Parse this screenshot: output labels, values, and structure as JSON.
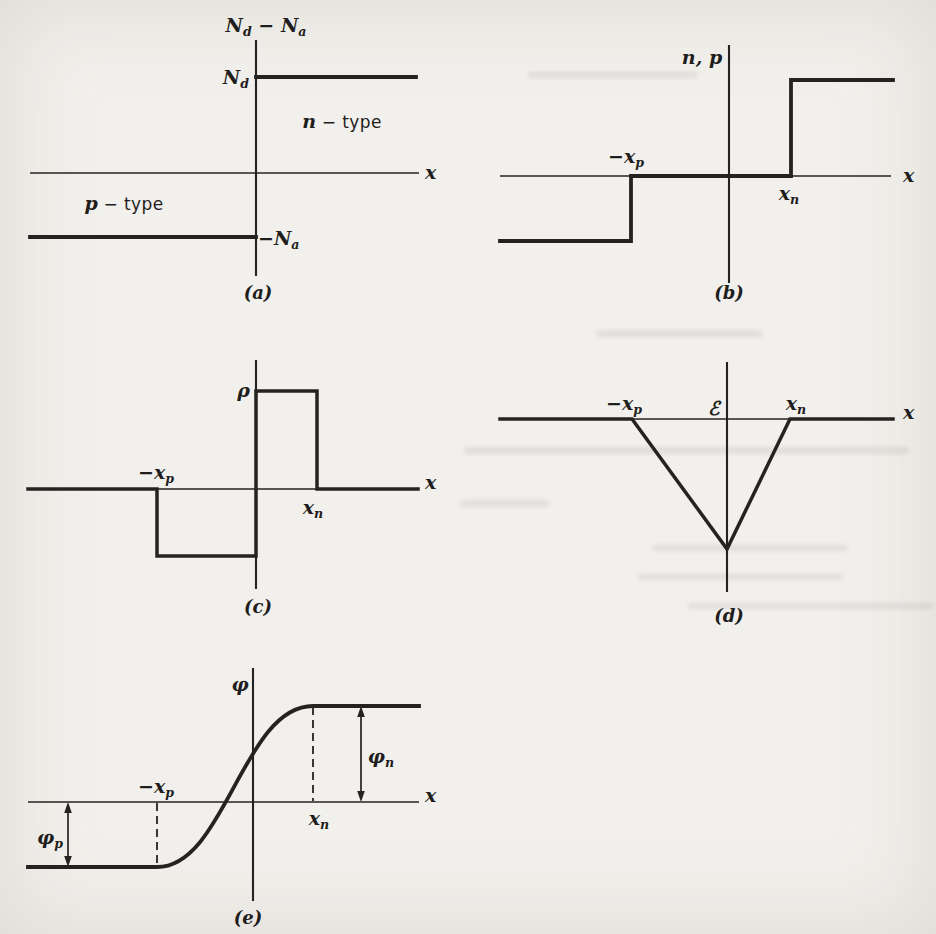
{
  "page": {
    "background": "#f2f0ec",
    "ink": "#242321"
  },
  "panels": {
    "a": {
      "caption": "(a)",
      "x_axis_label": "x",
      "y_axis_title": {
        "base1": "N",
        "sub1": "d",
        "mid": " − ",
        "base2": "N",
        "sub2": "a"
      },
      "level_nd": {
        "base": "N",
        "sub": "d"
      },
      "level_na": {
        "base": "−N",
        "sub": "a"
      },
      "region_n": {
        "var": "n",
        "rest": " − type"
      },
      "region_p": {
        "var": "p",
        "rest": " − type"
      }
    },
    "b": {
      "caption": "(b)",
      "x_axis_label": "x",
      "y_axis_title": {
        "n": "n",
        "sep": ",  ",
        "p": "p"
      },
      "xp": {
        "base": "−x",
        "sub": "p"
      },
      "xn": {
        "base": "x",
        "sub": "n"
      }
    },
    "c": {
      "caption": "(c)",
      "x_axis_label": "x",
      "y_axis_title": "ρ",
      "xp": {
        "base": "−x",
        "sub": "p"
      },
      "xn": {
        "base": "x",
        "sub": "n"
      }
    },
    "d": {
      "caption": "(d)",
      "x_axis_label": "x",
      "field_symbol": "ℰ",
      "xp": {
        "base": "−x",
        "sub": "p"
      },
      "xn": {
        "base": "x",
        "sub": "n"
      }
    },
    "e": {
      "caption": "(e)",
      "x_axis_label": "x",
      "y_axis_title": "φ",
      "xp": {
        "base": "−x",
        "sub": "p"
      },
      "xn": {
        "base": "x",
        "sub": "n"
      },
      "phi_n": {
        "base": "φ",
        "sub": "n"
      },
      "phi_p": {
        "base": "φ",
        "sub": "p"
      }
    }
  },
  "shapes": {
    "a": {
      "yaxis": [
        256,
        40,
        256,
        276
      ],
      "xaxis": [
        30,
        173,
        419,
        173
      ],
      "nd_level": "256,77 416,77",
      "na_level": "30,237 256,237"
    },
    "b": {
      "yaxis": [
        729,
        45,
        729,
        283
      ],
      "xaxis": [
        500,
        176,
        891,
        176
      ],
      "curve": "500,241 631,241 631,176 791,176 791,80 893,80"
    },
    "c": {
      "yaxis": [
        256,
        360,
        256,
        589
      ],
      "xaxis": [
        28,
        489,
        419,
        489
      ],
      "curve": "28,489 157,489 157,556 256,556 256,391 317,391 317,489 418,489"
    },
    "d": {
      "yaxis": [
        727,
        362,
        727,
        592
      ],
      "xaxis": [
        500,
        419,
        891,
        419
      ],
      "curve": "500,419 632,419 727,549 790,419 893,419"
    },
    "e": {
      "yaxis": [
        253,
        668,
        253,
        901
      ],
      "xaxis": [
        28,
        802,
        419,
        802
      ],
      "curve": "M28,867 L157,867 C225,867 243,706 313,706 L419,706",
      "dash_left": [
        157,
        803,
        157,
        866
      ],
      "dash_right": [
        313,
        707,
        313,
        801
      ],
      "arrow_left": [
        68,
        809,
        68,
        859
      ],
      "arrow_right": [
        361,
        713,
        361,
        795
      ],
      "arrowheads": {
        "left_top": "M68,802 L64.2,813 L71.8,813 Z",
        "left_bottom": "M68,867 L64.2,856 L71.8,856 Z",
        "right_top": "M361,706 L357.2,717 L364.8,717 Z",
        "right_bottom": "M361,802 L357.2,791 L364.8,791 Z"
      }
    }
  }
}
